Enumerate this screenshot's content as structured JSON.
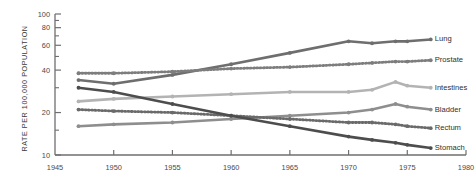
{
  "chart_data": {
    "type": "line",
    "title": "",
    "subtitle": "",
    "xlabel": "",
    "ylabel": "RATE PER 100,000 POPULATION",
    "yscale": "log",
    "ylim": [
      10,
      100
    ],
    "xlim": [
      1945,
      1980
    ],
    "grid": false,
    "legend_position": "right-inline",
    "yticks": [
      10,
      20,
      40,
      60,
      80,
      100
    ],
    "ytick_labels": [
      "10",
      "20",
      "40",
      "60",
      "80",
      "100"
    ],
    "yminor_ticks": [
      15,
      30,
      50,
      70,
      90
    ],
    "xticks": [
      1945,
      1950,
      1955,
      1960,
      1965,
      1970,
      1975,
      1980
    ],
    "xtick_labels": [
      "1945",
      "1950",
      "1955",
      "1960",
      "1965",
      "1970",
      "1975",
      "1980"
    ],
    "series": [
      {
        "name": "Lung",
        "style": "solid",
        "color": "#6e6e6e",
        "label": "Lung",
        "x": [
          1947,
          1950,
          1955,
          1960,
          1965,
          1970,
          1972,
          1974,
          1975,
          1977
        ],
        "values": [
          34,
          32,
          37,
          44,
          53,
          64,
          62,
          64,
          64,
          66
        ]
      },
      {
        "name": "Prostate",
        "style": "dotted",
        "color": "#7d7d7d",
        "label": "Prostate",
        "x": [
          1947,
          1950,
          1955,
          1960,
          1965,
          1970,
          1972,
          1974,
          1975,
          1977
        ],
        "values": [
          38,
          38,
          39,
          41,
          42,
          44,
          45,
          46,
          46,
          47
        ]
      },
      {
        "name": "Intestines",
        "style": "solid",
        "color": "#b3b3b3",
        "label": "Intestines",
        "x": [
          1947,
          1950,
          1955,
          1960,
          1965,
          1970,
          1972,
          1974,
          1975,
          1977
        ],
        "values": [
          24,
          25,
          26,
          27,
          28,
          28,
          29,
          33,
          31,
          30
        ]
      },
      {
        "name": "Bladder",
        "style": "solid",
        "color": "#8e8e8e",
        "label": "Bladder",
        "x": [
          1947,
          1950,
          1955,
          1960,
          1965,
          1970,
          1972,
          1974,
          1975,
          1977
        ],
        "values": [
          16,
          16.5,
          17,
          18,
          19,
          20,
          21,
          23,
          22,
          21
        ]
      },
      {
        "name": "Rectum",
        "style": "dotted",
        "color": "#6a6a6a",
        "label": "Rectum",
        "x": [
          1947,
          1950,
          1955,
          1960,
          1965,
          1970,
          1972,
          1974,
          1975,
          1977
        ],
        "values": [
          21,
          20.5,
          20,
          19,
          18,
          17,
          17,
          16.5,
          16,
          15.5
        ]
      },
      {
        "name": "Stomach",
        "style": "solid",
        "color": "#4d4d4d",
        "label": "Stomach",
        "x": [
          1947,
          1950,
          1955,
          1960,
          1965,
          1970,
          1972,
          1974,
          1975,
          1977
        ],
        "values": [
          30,
          28,
          23,
          19,
          16,
          13.5,
          12.8,
          12.2,
          11.8,
          11.2
        ]
      }
    ]
  },
  "axis": {
    "y_title": "RATE PER 100,000 POPULATION"
  }
}
